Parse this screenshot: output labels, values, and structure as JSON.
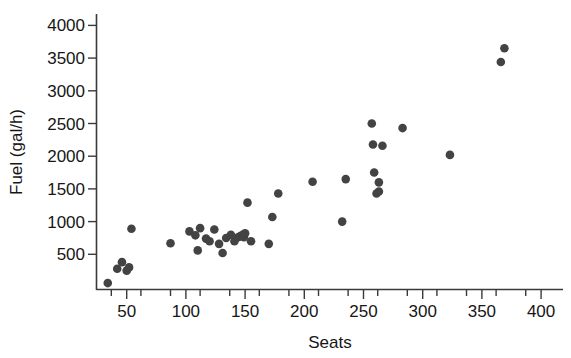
{
  "chart_data": {
    "type": "scatter",
    "title": "",
    "xlabel": "Seats",
    "ylabel": "Fuel (gal/h)",
    "xlim": [
      30,
      410
    ],
    "ylim": [
      0,
      4150
    ],
    "xticks": [
      50,
      100,
      150,
      200,
      250,
      300,
      350,
      400
    ],
    "yticks": [
      500,
      1000,
      1500,
      2000,
      2500,
      3000,
      3500,
      4000
    ],
    "xtick_labels": [
      "50",
      "100",
      "150",
      "200",
      "250",
      "300",
      "350",
      "400"
    ],
    "ytick_labels": [
      "500",
      "1000",
      "1500",
      "2000",
      "2500",
      "3000",
      "3500",
      "4000"
    ],
    "minor_xticks": [
      37,
      62,
      87,
      112,
      137,
      162,
      187,
      212,
      237,
      262,
      287,
      312,
      337,
      362,
      387
    ],
    "grid": false,
    "legend": null,
    "marker": "filled-circle",
    "marker_color": "#434343",
    "marker_size": 5,
    "axis_color": "#3a3a3a",
    "background_color": "#ffffff",
    "n_points": 43,
    "points": [
      {
        "seats": 34,
        "fuel": 60
      },
      {
        "seats": 42,
        "fuel": 280
      },
      {
        "seats": 46,
        "fuel": 380
      },
      {
        "seats": 50,
        "fuel": 250
      },
      {
        "seats": 52,
        "fuel": 300
      },
      {
        "seats": 54,
        "fuel": 890
      },
      {
        "seats": 87,
        "fuel": 670
      },
      {
        "seats": 103,
        "fuel": 850
      },
      {
        "seats": 108,
        "fuel": 790
      },
      {
        "seats": 110,
        "fuel": 560
      },
      {
        "seats": 112,
        "fuel": 900
      },
      {
        "seats": 117,
        "fuel": 740
      },
      {
        "seats": 120,
        "fuel": 700
      },
      {
        "seats": 124,
        "fuel": 880
      },
      {
        "seats": 128,
        "fuel": 660
      },
      {
        "seats": 131,
        "fuel": 520
      },
      {
        "seats": 134,
        "fuel": 750
      },
      {
        "seats": 138,
        "fuel": 800
      },
      {
        "seats": 141,
        "fuel": 700
      },
      {
        "seats": 144,
        "fuel": 760
      },
      {
        "seats": 146,
        "fuel": 780
      },
      {
        "seats": 148,
        "fuel": 800
      },
      {
        "seats": 149,
        "fuel": 760
      },
      {
        "seats": 150,
        "fuel": 820
      },
      {
        "seats": 152,
        "fuel": 1290
      },
      {
        "seats": 155,
        "fuel": 700
      },
      {
        "seats": 170,
        "fuel": 660
      },
      {
        "seats": 173,
        "fuel": 1070
      },
      {
        "seats": 178,
        "fuel": 1430
      },
      {
        "seats": 207,
        "fuel": 1610
      },
      {
        "seats": 232,
        "fuel": 1000
      },
      {
        "seats": 235,
        "fuel": 1650
      },
      {
        "seats": 257,
        "fuel": 2500
      },
      {
        "seats": 258,
        "fuel": 2180
      },
      {
        "seats": 259,
        "fuel": 1750
      },
      {
        "seats": 261,
        "fuel": 1430
      },
      {
        "seats": 263,
        "fuel": 1600
      },
      {
        "seats": 266,
        "fuel": 2160
      },
      {
        "seats": 283,
        "fuel": 2430
      },
      {
        "seats": 323,
        "fuel": 2020
      },
      {
        "seats": 366,
        "fuel": 3440
      },
      {
        "seats": 369,
        "fuel": 3650
      },
      {
        "seats": 263,
        "fuel": 1460
      }
    ]
  }
}
